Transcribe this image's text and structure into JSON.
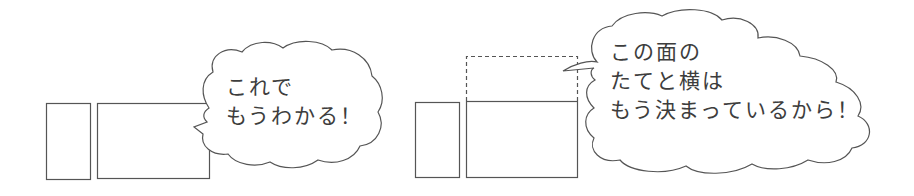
{
  "panels": [
    {
      "id": "left",
      "speech": {
        "lines": [
          "これで",
          "もうわかる！"
        ]
      },
      "shapes": [
        "small-rectangle",
        "large-rectangle"
      ]
    },
    {
      "id": "right",
      "speech": {
        "lines": [
          "この面の",
          "たてと横は",
          "もう決まっているから！"
        ]
      },
      "shapes": [
        "small-rectangle",
        "large-rectangle",
        "dashed-rectangle-above"
      ]
    }
  ],
  "colors": {
    "stroke": "#555555",
    "text": "#3d3d3d",
    "background": "#ffffff"
  }
}
